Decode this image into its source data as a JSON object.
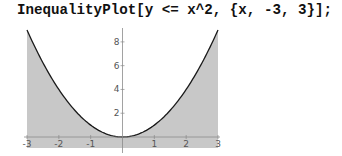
{
  "input": {
    "code": "InequalityPlot[y <= x^2, {x, -3, 3}];"
  },
  "colors": {
    "fill": "#c8c8c8",
    "curve": "#1a1a1a",
    "axis": "#8a8a8a",
    "tick_label": "#555555"
  },
  "chart_data": {
    "type": "area",
    "title": "",
    "function": "y <= x^2",
    "x": [
      -3,
      -2.5,
      -2,
      -1.5,
      -1,
      -0.5,
      0,
      0.5,
      1,
      1.5,
      2,
      2.5,
      3
    ],
    "y": [
      9,
      6.25,
      4,
      2.25,
      1,
      0.25,
      0,
      0.25,
      1,
      2.25,
      4,
      6.25,
      9
    ],
    "region": "below curve y = x^2 (shaded)",
    "xlim": [
      -3,
      3
    ],
    "ylim": [
      -0.9,
      9
    ],
    "xticks": [
      -3,
      -2,
      -1,
      1,
      2,
      3
    ],
    "yticks": [
      2,
      4,
      6,
      8
    ],
    "xlabel": "",
    "ylabel": "",
    "grid": false,
    "legend": null
  }
}
